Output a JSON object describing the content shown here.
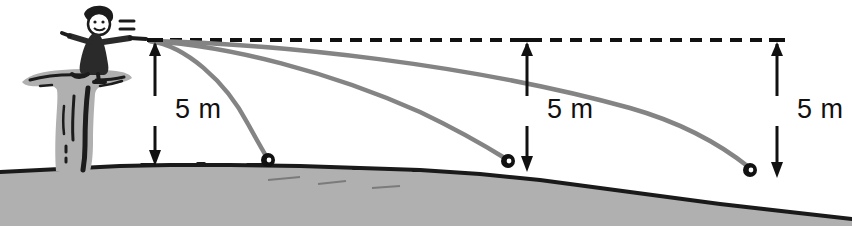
{
  "figure": {
    "colors": {
      "trajectory": "#848484",
      "ground_fill": "#b0b0b0",
      "ground_edge": "#1a1a1a",
      "cliff_fill": "#b0b0b0",
      "cliff_detail": "#1c1c1c",
      "ink": "#111111",
      "ball_fill": "#111111",
      "ball_highlight": "#ffffff",
      "background": "#ffffff"
    },
    "reference_line": {
      "name": "horizontal-dashed-line",
      "y": 40,
      "x_start": 150,
      "x_end": 775,
      "dash": "12 8",
      "width": 4
    },
    "launch_point": {
      "x": 148,
      "y": 40
    },
    "thrower": {
      "label": "cartoon figure throwing",
      "x": 62,
      "y": 6,
      "motion_lines": 2
    },
    "measurements": [
      {
        "label": "5 m",
        "x": 155,
        "y_top": 40,
        "y_bottom": 166,
        "text_x": 175,
        "text_y": 118
      },
      {
        "label": "5 m",
        "x": 527,
        "y_top": 40,
        "y_bottom": 172,
        "text_x": 547,
        "text_y": 118
      },
      {
        "label": "5 m",
        "x": 777,
        "y_top": 40,
        "y_bottom": 178,
        "text_x": 797,
        "text_y": 118
      }
    ],
    "trajectories": [
      {
        "name": "slow-throw",
        "path": "M 150 41 C 185 46 225 80 248 124 C 258 142 264 153 268 159",
        "landing": {
          "x": 268,
          "y": 160
        }
      },
      {
        "name": "medium-throw",
        "path": "M 150 41 C 230 46 330 72 420 112 C 462 132 492 150 508 160",
        "landing": {
          "x": 508,
          "y": 161
        }
      },
      {
        "name": "fast-throw",
        "path": "M 150 41 C 280 44 470 64 630 108 C 690 125 730 152 750 168",
        "landing": {
          "x": 750,
          "y": 170
        }
      }
    ],
    "balls": [
      {
        "name": "ball-1",
        "x": 268,
        "y": 160,
        "r": 7
      },
      {
        "name": "ball-2",
        "x": 508,
        "y": 161,
        "r": 7
      },
      {
        "name": "ball-3",
        "x": 750,
        "y": 170,
        "r": 7
      }
    ],
    "ground": {
      "name": "ground-terrain",
      "top_edge": "M 0 172 L 40 170 L 80 168 L 120 166 L 170 165 L 230 165 L 300 166 L 360 168 L 420 170 L 480 174 L 540 180 L 600 188 L 660 196 L 720 204 L 790 212 L 852 219",
      "fill": "M 0 172 L 40 170 L 80 168 L 120 166 L 170 165 L 230 165 L 300 166 L 360 168 L 420 170 L 480 174 L 540 180 L 600 188 L 660 196 L 720 204 L 790 212 L 852 219 L 852 226 L 0 226 Z"
    },
    "cliff": {
      "name": "cliff-pillar",
      "outline": "M 22 82 C 30 74 44 71 62 70 C 80 68 100 69 116 71 C 124 72 130 74 132 78 C 126 82 116 84 106 85 C 100 86 96 88 95 94 C 94 108 93 126 93 142 C 93 154 92 164 90 171 L 56 171 C 55 160 55 142 56 124 C 57 108 58 96 57 90 C 56 86 50 85 42 86 C 32 87 25 86 22 82 Z"
    }
  }
}
